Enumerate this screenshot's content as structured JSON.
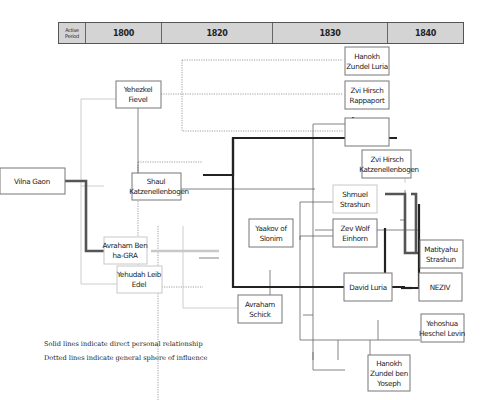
{
  "timeline": {
    "label": "Active Period",
    "periods": [
      "1800",
      "1820",
      "1830",
      "1840"
    ]
  },
  "nodes": {
    "vilna_gaon": [
      "Vilna Gaon"
    ],
    "yehezkel_fievel": [
      "Yehezkel",
      "Fievel"
    ],
    "shaul_katzenellenbogen": [
      "Shaul",
      "Katzenellenbogen"
    ],
    "avraham_ben_hagra": [
      "Avraham Ben",
      "ha-GRA"
    ],
    "yehudah_leib_edel": [
      "Yehudah Leib",
      "Edel"
    ],
    "yaakov_of_slonim": [
      "Yaakov of",
      "Slonim"
    ],
    "avraham_schick": [
      "Avraham",
      "Schick"
    ],
    "hanokh_zundel_luria": [
      "Hanokh",
      "Zundel Luria"
    ],
    "zvi_hirsch_rappaport": [
      "Zvi Hirsch",
      "Rappaport"
    ],
    "yitzhak_eliyahu_landau": [
      "Yitzhak",
      "Eliyahu Landau"
    ],
    "zvi_hirsch_katzenellenbogen": [
      "Zvi Hirsch",
      "Katzenellenbogen"
    ],
    "shmuel_strashun": [
      "Shmuel",
      "Strashun"
    ],
    "zev_wolf_einhorn": [
      "Zev Wolf",
      "Einhorn"
    ],
    "matityahu_strashun": [
      "Matityahu",
      "Strashun"
    ],
    "david_luria": [
      "David Luria"
    ],
    "neziv": [
      "NEZIV"
    ],
    "yehoshua_heschel_levin": [
      "Yehoshua",
      "Heschel Levin"
    ],
    "hanokh_zundel_ben_yoseph": [
      "Hanokh",
      "Zundel ben",
      "Yoseph"
    ]
  },
  "legend": {
    "solid": "Solid lines indicate direct personal relationship",
    "dotted": "Dotted lines indicate general sphere of influence"
  }
}
